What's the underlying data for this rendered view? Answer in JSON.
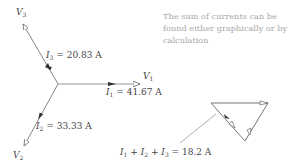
{
  "diagram": {
    "phasors": {
      "v1": {
        "label": "V",
        "sub": "1"
      },
      "v2": {
        "label": "V",
        "sub": "2"
      },
      "v3": {
        "label": "V",
        "sub": "3"
      }
    },
    "currents": {
      "i1": {
        "label": "I",
        "sub": "1",
        "value": " = 41.67 A"
      },
      "i2": {
        "label": "I",
        "sub": "2",
        "value": " = 33.33 A"
      },
      "i3": {
        "label": "I",
        "sub": "3",
        "value": " = 20.83 A"
      }
    },
    "note": "The sum of currents can be found either graphically or by calculation",
    "sum": {
      "i1": "I",
      "s1": "1",
      "plus1": " + ",
      "i2": "I",
      "s2": "2",
      "plus2": " + ",
      "i3": "I",
      "s3": "3",
      "result": " = 18.2 A"
    }
  }
}
